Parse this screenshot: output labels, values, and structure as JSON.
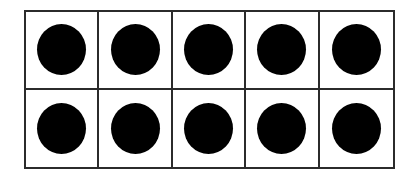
{
  "ten_frame": {
    "rows": 2,
    "columns": 5,
    "border_color": "#2b2b2b",
    "counter_color": "#000000",
    "cells": [
      [
        true,
        true,
        true,
        true,
        true
      ],
      [
        true,
        true,
        true,
        true,
        true
      ]
    ],
    "filled_count": 10
  }
}
